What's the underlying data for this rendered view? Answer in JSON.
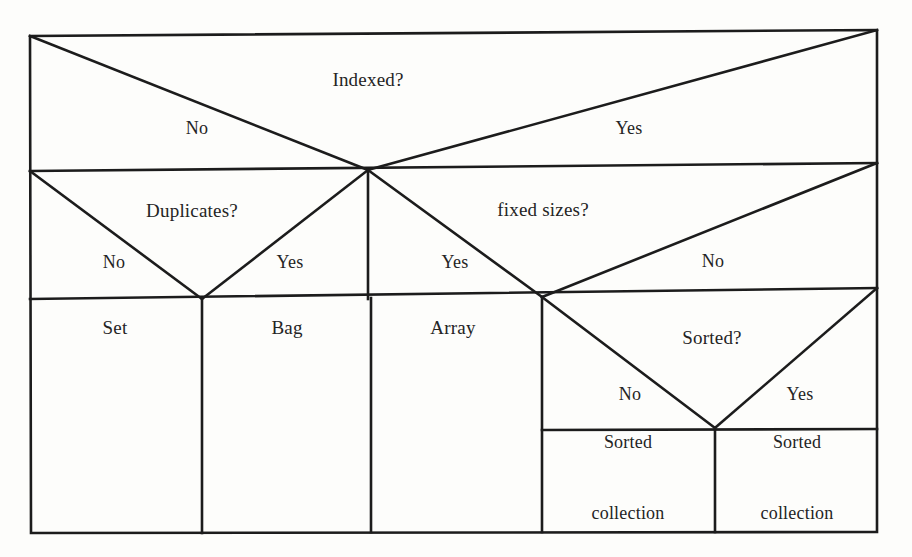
{
  "diagram": {
    "type": "decision-tree",
    "stroke_color": "#1c1c1c",
    "background_color": "#fdfdfb",
    "frame": {
      "left": 30,
      "top": 35,
      "right": 877,
      "bottom": 532
    },
    "questions": [
      {
        "id": "indexed",
        "text": "Indexed?",
        "x": 368,
        "y": 80
      },
      {
        "id": "duplicates",
        "text": "Duplicates?",
        "x": 192,
        "y": 211
      },
      {
        "id": "fixed-sizes",
        "text": "fixed sizes?",
        "x": 543,
        "y": 210
      },
      {
        "id": "sorted",
        "text": "Sorted?",
        "x": 712,
        "y": 338
      }
    ],
    "branches": [
      {
        "id": "indexed-no",
        "text": "No",
        "x": 197,
        "y": 128
      },
      {
        "id": "indexed-yes",
        "text": "Yes",
        "x": 629,
        "y": 128
      },
      {
        "id": "duplicates-no",
        "text": "No",
        "x": 114,
        "y": 262
      },
      {
        "id": "duplicates-yes",
        "text": "Yes",
        "x": 290,
        "y": 262
      },
      {
        "id": "fixed-sizes-yes",
        "text": "Yes",
        "x": 455,
        "y": 262
      },
      {
        "id": "fixed-sizes-no",
        "text": "No",
        "x": 713,
        "y": 261
      },
      {
        "id": "sorted-no",
        "text": "No",
        "x": 630,
        "y": 394
      },
      {
        "id": "sorted-yes",
        "text": "Yes",
        "x": 800,
        "y": 394
      }
    ],
    "results": [
      {
        "id": "set",
        "text": "Set",
        "x": 115,
        "y": 328
      },
      {
        "id": "bag",
        "text": "Bag",
        "x": 287,
        "y": 328
      },
      {
        "id": "array",
        "text": "Array",
        "x": 453,
        "y": 328
      },
      {
        "id": "sorted-collection-no",
        "line1": "Sorted",
        "line2": "collection",
        "x": 628,
        "y": 478
      },
      {
        "id": "sorted-collection-yes",
        "line1": "Sorted",
        "line2": "collection",
        "x": 797,
        "y": 478
      }
    ],
    "geometry": {
      "outer_frame": "M30,36 L877,30 L877,532 L31,533 Z",
      "row1_divider": "M30,171 L877,163",
      "row2_divider": "M30,299 L877,288",
      "bottom_edge": "M31,533 L877,532",
      "hub_point": {
        "x": 368,
        "y": 170
      },
      "indexed_no_edge": "M30,36 L368,170",
      "indexed_yes_edge": "M877,30 L368,170",
      "duplicates_left_edge": "M30,171 L202,299",
      "duplicates_right_edge": "M368,170 L202,299",
      "array_edge": "M368,170 L368,299",
      "fixed_yes_edge": "M368,170 L542,297",
      "fixed_no_edge": "M877,163 L542,297",
      "vdiv_set_bag": "M202,299 L202,533",
      "vdiv_bag_array": "M371,298 L371,532",
      "vdiv_array_sorted": "M542,297 L542,532",
      "sorted_no_edge": "M542,297 L715,428",
      "sorted_yes_edge": "M877,288 L715,428",
      "sorted_row_divider": "M542,430 L877,429",
      "vdiv_sorted_results": "M715,428 L715,532"
    }
  }
}
